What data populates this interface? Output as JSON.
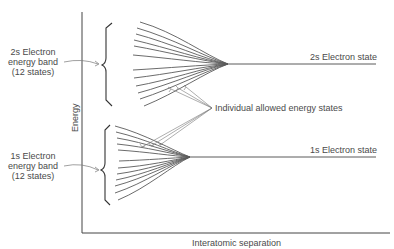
{
  "diagram": {
    "title": "",
    "axes": {
      "y_label": "Energy",
      "x_label": "Interatomic separation"
    },
    "bands": [
      {
        "name": "2s",
        "band_label_lines": [
          "2s Electron",
          "energy band",
          "(12 states)"
        ],
        "state_label": "2s Electron state",
        "num_states": 12
      },
      {
        "name": "1s",
        "band_label_lines": [
          "1s Electron",
          "energy band",
          "(12 states)"
        ],
        "state_label": "1s Electron state",
        "num_states": 12
      }
    ],
    "annotation": "Individual allowed energy states",
    "colors": {
      "lines": "#555555",
      "axis": "#444444",
      "text": "#4a4a4a",
      "background": "#ffffff"
    }
  }
}
